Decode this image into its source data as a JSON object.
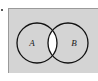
{
  "figure": {
    "kind": "venn-diagram",
    "panel": {
      "background_color": "#d4d4d4",
      "border_color": "#9a9a9a",
      "page_background_color": "#ffffff"
    },
    "sets": [
      {
        "id": "A",
        "label": "A",
        "position": "left"
      },
      {
        "id": "B",
        "label": "B",
        "position": "right"
      }
    ],
    "intersection": {
      "label": "",
      "fill_color": "#ffffff",
      "description": "lens-shaped overlap region shaded white"
    },
    "stroke_color": "#111111",
    "marks": {
      "corner_dot": "."
    }
  }
}
